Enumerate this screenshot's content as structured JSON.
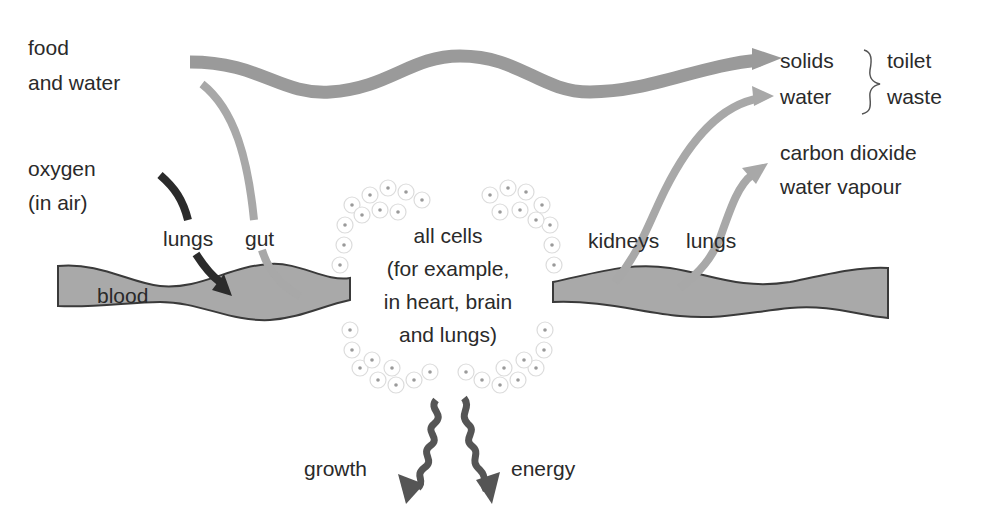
{
  "diagram": {
    "title": "",
    "colors": {
      "blood_fill": "#a9a9a9",
      "blood_outline": "#3a3a3a",
      "arrow_grey": "#9a9a9a",
      "arrow_light": "#a8a8a8",
      "arrow_dark": "#2b2b2b",
      "arrow_wavy": "#555555",
      "text": "#2a2a2a",
      "cell_outline": "#dcdcdc",
      "cell_dot": "#9a9a9a"
    },
    "inputs": {
      "food_line1": "food",
      "food_line2": "and water",
      "oxygen_line1": "oxygen",
      "oxygen_line2": "(in air)"
    },
    "organs": {
      "lungs_in": "lungs",
      "gut": "gut",
      "kidneys": "kidneys",
      "lungs_out": "lungs"
    },
    "blood": {
      "label": "blood"
    },
    "cells": {
      "line1": "all cells",
      "line2": "(for example,",
      "line3": "in heart, brain",
      "line4": "and lungs)"
    },
    "outputs": {
      "solids": "solids",
      "water": "water",
      "toilet": "toilet",
      "waste": "waste",
      "co2": "carbon dioxide",
      "vapour": "water vapour"
    },
    "products": {
      "growth": "growth",
      "energy": "energy"
    }
  }
}
